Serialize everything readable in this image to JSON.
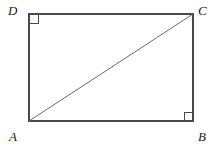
{
  "figure": {
    "kind": "rectangle-with-diagonal",
    "caption": "",
    "background_color": "#ffffff",
    "stroke_color": "#4a4a4a",
    "diagonal_color": "#6b6b6b",
    "label_color": "#1a1a1a",
    "rectangle": {
      "left": 29,
      "top": 14,
      "right": 193,
      "bottom": 121,
      "width": 164,
      "height": 107,
      "stroke_width": 1.4
    },
    "diagonal": {
      "from": "A",
      "to": "C",
      "x1": 29,
      "y1": 121,
      "x2": 193,
      "y2": 14,
      "stroke_width": 1
    },
    "vertices": [
      {
        "id": "D",
        "label": "D",
        "position": "top-left",
        "x": 29,
        "y": 14,
        "right_angle": true
      },
      {
        "id": "C",
        "label": "C",
        "position": "top-right",
        "x": 193,
        "y": 14,
        "right_angle": false
      },
      {
        "id": "A",
        "label": "A",
        "position": "bottom-left",
        "x": 29,
        "y": 121,
        "right_angle": false
      },
      {
        "id": "B",
        "label": "B",
        "position": "bottom-right",
        "x": 193,
        "y": 121,
        "right_angle": true
      }
    ],
    "right_angle_markers": [
      {
        "at": "D",
        "size": 8,
        "x": 30,
        "y": 15
      },
      {
        "at": "B",
        "size": 8,
        "x": 184,
        "y": 112
      }
    ]
  }
}
